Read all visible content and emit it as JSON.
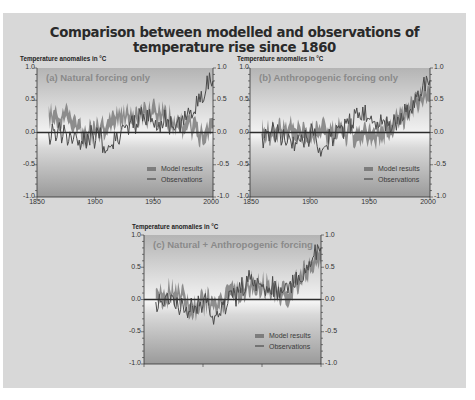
{
  "title": "Comparison between modelled and observations of temperature rise since 1860",
  "colors": {
    "frame_bg": "#d8d8d8",
    "model_band": "#7d7d7d",
    "observations": "#4a4a4a",
    "zero_line": "#2b2b2b"
  },
  "legend": {
    "model": "Model results",
    "obs": "Observations"
  },
  "axis": {
    "ylabel": "Temperature anomalies in °C",
    "yticks": [
      "1.0",
      "0.5",
      "0.0",
      "-0.5",
      "-1.0"
    ],
    "xticks": [
      "1850",
      "1900",
      "1950",
      "2000"
    ]
  },
  "panels": [
    {
      "id": "a",
      "title": "(a) Natural forcing only"
    },
    {
      "id": "b",
      "title": "(b) Anthropogenic forcing only"
    },
    {
      "id": "c",
      "title": "(c) Natural + Anthropogenic forcing"
    }
  ],
  "chart_data": [
    {
      "type": "line",
      "title": "(a) Natural forcing only",
      "ylabel": "Temperature anomalies in °C",
      "xlabel": "",
      "xlim": [
        1850,
        2000
      ],
      "ylim": [
        -1.0,
        1.0
      ],
      "xticks": [
        1850,
        1900,
        1950,
        2000
      ],
      "yticks": [
        -1.0,
        -0.5,
        0.0,
        0.5,
        1.0
      ],
      "legend": [
        "Model results",
        "Observations"
      ],
      "legend_position": "lower right",
      "x": [
        1860,
        1870,
        1880,
        1890,
        1900,
        1910,
        1920,
        1930,
        1940,
        1950,
        1960,
        1970,
        1980,
        1990,
        2000
      ],
      "series": [
        {
          "name": "Observations",
          "values": [
            -0.05,
            0.0,
            -0.05,
            -0.15,
            -0.05,
            -0.2,
            -0.05,
            0.1,
            0.25,
            0.15,
            0.2,
            0.1,
            0.3,
            0.55,
            0.85
          ]
        },
        {
          "name": "Model results (center)",
          "values": [
            0.22,
            0.25,
            0.2,
            -0.05,
            0.05,
            0.12,
            0.22,
            0.25,
            0.25,
            0.3,
            0.25,
            0.1,
            0.12,
            -0.05,
            0.1
          ]
        }
      ]
    },
    {
      "type": "line",
      "title": "(b) Anthropogenic forcing only",
      "ylabel": "Temperature anomalies in °C",
      "xlabel": "",
      "xlim": [
        1850,
        2000
      ],
      "ylim": [
        -1.0,
        1.0
      ],
      "xticks": [
        1850,
        1900,
        1950,
        2000
      ],
      "yticks": [
        -1.0,
        -0.5,
        0.0,
        0.5,
        1.0
      ],
      "legend": [
        "Model results",
        "Observations"
      ],
      "legend_position": "lower right",
      "x": [
        1860,
        1870,
        1880,
        1890,
        1900,
        1910,
        1920,
        1930,
        1940,
        1950,
        1960,
        1970,
        1980,
        1990,
        2000
      ],
      "series": [
        {
          "name": "Observations",
          "values": [
            -0.05,
            0.0,
            -0.05,
            -0.15,
            -0.05,
            -0.2,
            -0.05,
            0.1,
            0.3,
            0.2,
            0.2,
            0.1,
            0.3,
            0.55,
            0.85
          ]
        },
        {
          "name": "Model results (center)",
          "values": [
            0.0,
            0.0,
            0.05,
            0.05,
            0.0,
            0.05,
            0.0,
            0.0,
            0.0,
            -0.05,
            0.0,
            0.1,
            0.3,
            0.45,
            0.65
          ]
        }
      ]
    },
    {
      "type": "line",
      "title": "(c) Natural + Anthropogenic forcing",
      "ylabel": "Temperature anomalies in °C",
      "xlabel": "",
      "xlim": [
        1850,
        2000
      ],
      "ylim": [
        -1.0,
        1.0
      ],
      "yticks": [
        -1.0,
        -0.5,
        0.0,
        0.5,
        1.0
      ],
      "legend": [
        "Model results",
        "Observations"
      ],
      "legend_position": "lower right",
      "x": [
        1860,
        1870,
        1880,
        1890,
        1900,
        1910,
        1920,
        1930,
        1940,
        1950,
        1960,
        1970,
        1980,
        1990,
        2000
      ],
      "series": [
        {
          "name": "Observations",
          "values": [
            -0.05,
            0.0,
            -0.05,
            -0.15,
            -0.05,
            -0.2,
            -0.05,
            0.1,
            0.3,
            0.2,
            0.2,
            0.1,
            0.3,
            0.55,
            0.85
          ]
        },
        {
          "name": "Model results (center)",
          "values": [
            0.05,
            0.1,
            0.1,
            -0.15,
            0.0,
            -0.1,
            0.0,
            0.1,
            0.25,
            0.2,
            0.2,
            0.05,
            0.3,
            0.45,
            0.7
          ]
        }
      ]
    }
  ]
}
